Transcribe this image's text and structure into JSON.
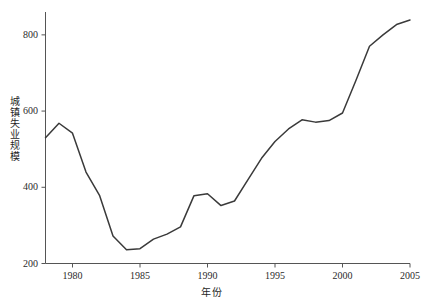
{
  "chart_data": {
    "type": "line",
    "title": "",
    "subtitle": "",
    "xlabel": "年份",
    "ylabel": "城镇失业规模",
    "xlim": [
      1978,
      2005
    ],
    "ylim": [
      200,
      860
    ],
    "grid": false,
    "legend": null,
    "line_color": "#3a3a3a",
    "axis_color": "#555555",
    "xticks": [
      1980,
      1985,
      1990,
      1995,
      2000,
      2005
    ],
    "xtick_labels": [
      "1980",
      "1985",
      "1990",
      "1995",
      "2000",
      "2005"
    ],
    "yticks": [
      200,
      400,
      600,
      800
    ],
    "ytick_labels": [
      "200",
      "400",
      "600",
      "800"
    ],
    "x": [
      1978,
      1979,
      1980,
      1981,
      1982,
      1983,
      1984,
      1985,
      1986,
      1987,
      1988,
      1989,
      1990,
      1991,
      1992,
      1993,
      1994,
      1995,
      1996,
      1997,
      1998,
      1999,
      2000,
      2001,
      2002,
      2003,
      2004,
      2005
    ],
    "series": [
      {
        "name": "城镇失业规模",
        "values": [
          530,
          568,
          542,
          440,
          379,
          272,
          236,
          239,
          264,
          277,
          296,
          378,
          383,
          352,
          364,
          420,
          476,
          520,
          553,
          577,
          571,
          575,
          595,
          681,
          770,
          800,
          827,
          839
        ]
      }
    ]
  },
  "axis": {
    "y_title": "城镇失业规模",
    "x_title": "年份"
  }
}
